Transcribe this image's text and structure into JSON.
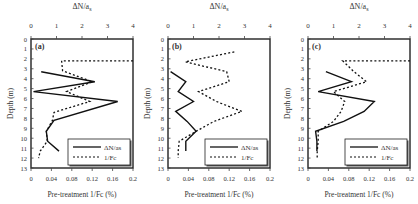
{
  "chart_data": [
    {
      "type": "line",
      "panel_label": "(a)",
      "title": "",
      "top_axis": {
        "label": "ΔN/a_s",
        "ticks": [
          "0",
          "1",
          "2",
          "3",
          "4"
        ],
        "range": [
          0,
          4
        ]
      },
      "bottom_axis": {
        "label": "Pre-treatment 1/Fc (%)",
        "ticks": [
          "0",
          "0.04",
          "0.08",
          "0.12",
          "0.16",
          "0.2"
        ],
        "range": [
          0,
          0.2
        ]
      },
      "ylabel": "Depth (m)",
      "y_ticks": [
        "0",
        "1",
        "2",
        "3",
        "4",
        "5",
        "6",
        "7",
        "8",
        "9",
        "10",
        "11",
        "12",
        "13"
      ],
      "ylim": [
        0,
        13
      ],
      "y_inverted": true,
      "legend": {
        "position": "lower right",
        "entries": [
          "ΔN/as",
          "1/Fc"
        ]
      },
      "series": [
        {
          "name": "ΔN/as",
          "axis": "top",
          "style": "solid",
          "depth": [
            3.3,
            4.3,
            5.3,
            6.3,
            8.2,
            9.3,
            10.3,
            11.3
          ],
          "values": [
            0.4,
            2.5,
            0.1,
            3.4,
            0.9,
            0.6,
            0.65,
            1.1
          ]
        },
        {
          "name": "1/Fc",
          "axis": "bottom",
          "style": "dotted",
          "depth": [
            2.2,
            2.2,
            3.2,
            4.3,
            5.3,
            6.3,
            7.4,
            8.2,
            9.3,
            10.3,
            11.3,
            12.0
          ],
          "values": [
            0.2,
            0.06,
            0.062,
            0.12,
            0.07,
            0.115,
            0.045,
            0.042,
            0.03,
            0.032,
            0.018,
            0.015
          ]
        }
      ]
    },
    {
      "type": "line",
      "panel_label": "(b)",
      "title": "",
      "top_axis": {
        "label": "ΔN/a_s",
        "ticks": [
          "0",
          "1",
          "2",
          "3",
          "4"
        ],
        "range": [
          0,
          4
        ]
      },
      "bottom_axis": {
        "label": "Pre-treatment 1/Fc (%)",
        "ticks": [
          "0",
          "0.04",
          "0.08",
          "0.12",
          "0.16",
          "0.2"
        ],
        "range": [
          0,
          0.2
        ]
      },
      "ylabel": "Depth (m)",
      "y_ticks": [
        "0",
        "1",
        "2",
        "3",
        "4",
        "5",
        "6",
        "7",
        "8",
        "9",
        "10",
        "11",
        "12",
        "13"
      ],
      "ylim": [
        0,
        13
      ],
      "y_inverted": true,
      "legend": {
        "position": "lower right",
        "entries": [
          "ΔN/as",
          "1/Fc"
        ]
      },
      "series": [
        {
          "name": "ΔN/as",
          "axis": "top",
          "style": "solid",
          "depth": [
            3.3,
            4.3,
            5.3,
            6.3,
            7.3,
            8.3,
            9.3,
            10.3,
            11.3
          ],
          "values": [
            0.1,
            0.7,
            0.4,
            1.0,
            0.3,
            0.75,
            1.1,
            0.7,
            0.7
          ]
        },
        {
          "name": "1/Fc",
          "axis": "bottom",
          "style": "dotted",
          "depth": [
            1.3,
            2.3,
            3.3,
            4.3,
            5.3,
            6.3,
            7.3,
            8.3,
            9.3,
            10.3,
            11.3,
            12.0
          ],
          "values": [
            0.13,
            0.034,
            0.115,
            0.12,
            0.06,
            0.095,
            0.145,
            0.09,
            0.055,
            0.022,
            0.02,
            0.02
          ]
        }
      ]
    },
    {
      "type": "line",
      "panel_label": "(c)",
      "title": "",
      "top_axis": {
        "label": "ΔN/a_s",
        "ticks": [
          "0",
          "1",
          "2",
          "3",
          "4"
        ],
        "range": [
          0,
          4
        ]
      },
      "bottom_axis": {
        "label": "Pre-treatment 1/Fc (%)",
        "ticks": [
          "0",
          "0.04",
          "0.08",
          "0.12",
          "0.16",
          "0.2"
        ],
        "range": [
          0,
          0.2
        ]
      },
      "ylabel": "Depth (m)",
      "y_ticks": [
        "0",
        "1",
        "2",
        "3",
        "4",
        "5",
        "6",
        "7",
        "8",
        "9",
        "10",
        "11",
        "12",
        "13"
      ],
      "ylim": [
        0,
        13
      ],
      "y_inverted": true,
      "legend": {
        "position": "lower right",
        "entries": [
          "ΔN/as",
          "1/Fc"
        ]
      },
      "series": [
        {
          "name": "ΔN/as",
          "axis": "top",
          "style": "solid",
          "depth": [
            3.3,
            4.3,
            5.3,
            6.3,
            7.3,
            8.3,
            9.3,
            10.3,
            11.3
          ],
          "values": [
            0.7,
            1.7,
            0.4,
            2.6,
            2.2,
            1.4,
            0.3,
            0.35,
            0.35
          ]
        },
        {
          "name": "1/Fc",
          "axis": "bottom",
          "style": "dotted",
          "depth": [
            2.2,
            2.2,
            3.3,
            4.3,
            5.3,
            6.3,
            7.3,
            8.3,
            9.3,
            10.3,
            11.3,
            12.0
          ],
          "values": [
            0.2,
            0.068,
            0.09,
            0.115,
            0.05,
            0.072,
            0.065,
            0.05,
            0.02,
            0.02,
            0.018,
            0.018
          ]
        }
      ]
    }
  ]
}
